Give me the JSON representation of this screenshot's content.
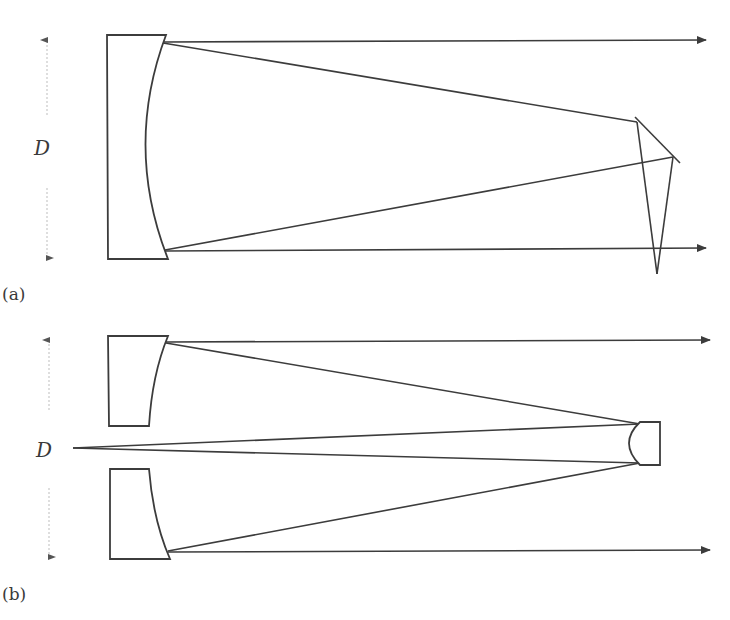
{
  "figure": {
    "panels": [
      {
        "id": "a",
        "label": "(a)",
        "dimension_label": "D",
        "description": "Newtonian-style reflector: concave primary mirror with flat diagonal (prism) secondary"
      },
      {
        "id": "b",
        "label": "(b)",
        "dimension_label": "D",
        "description": "Cassegrain-style reflector: concave primary with central hole and convex secondary mirror"
      }
    ],
    "colors": {
      "line": "#3c3c3c",
      "dimension": "#bdbdbd",
      "background": "#ffffff"
    }
  }
}
